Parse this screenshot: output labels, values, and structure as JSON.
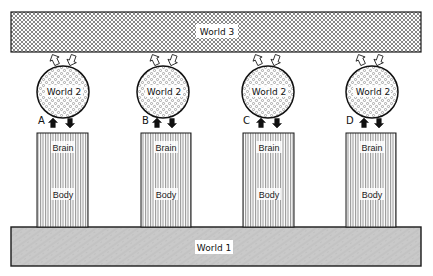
{
  "diagram": {
    "world3": {
      "label": "World 3"
    },
    "world1": {
      "label": "World 1"
    },
    "units": [
      {
        "letter": "A",
        "world2_label": "World 2",
        "brain_label": "Brain",
        "body_label": "Body",
        "cx": 63,
        "col_x": 37
      },
      {
        "letter": "B",
        "world2_label": "World 2",
        "brain_label": "Brain",
        "body_label": "Body",
        "cx": 161,
        "col_x": 141
      },
      {
        "letter": "C",
        "world2_label": "World 2",
        "brain_label": "Brain",
        "body_label": "Body",
        "cx": 263,
        "col_x": 243
      },
      {
        "letter": "D",
        "world2_label": "World 2",
        "brain_label": "Brain",
        "body_label": "Body",
        "cx": 367,
        "col_x": 346
      }
    ],
    "colors": {
      "stroke": "#1a1a1a",
      "world1_fill": "#c9c9c9",
      "background": "#ffffff"
    }
  }
}
